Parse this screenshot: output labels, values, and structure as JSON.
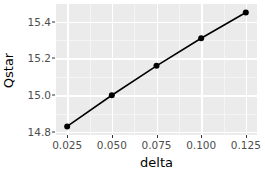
{
  "chart_data": {
    "type": "line",
    "title": "",
    "subtitle": "",
    "xlabel": "delta",
    "ylabel": "Qstar",
    "x": [
      0.025,
      0.05,
      0.075,
      0.1,
      0.125
    ],
    "values": [
      14.83,
      15.0,
      15.16,
      15.31,
      15.45
    ],
    "series": [
      {
        "name": "Qstar",
        "x": [
          0.025,
          0.05,
          0.075,
          0.1,
          0.125
        ],
        "values": [
          14.83,
          15.0,
          15.16,
          15.31,
          15.45
        ]
      }
    ],
    "xlim": [
      0.01875,
      0.13125
    ],
    "ylim": [
      14.7835,
      15.4965
    ],
    "x_ticks": [
      0.025,
      0.05,
      0.075,
      0.1,
      0.125
    ],
    "x_tick_labels": [
      "0.025",
      "0.050",
      "0.075",
      "0.100",
      "0.125"
    ],
    "y_ticks": [
      14.8,
      15.0,
      15.2,
      15.4
    ],
    "y_tick_labels": [
      "14.8",
      "15.0",
      "15.2",
      "15.4"
    ],
    "x_minor_ticks": [
      0.0375,
      0.0625,
      0.0875,
      0.1125
    ],
    "y_minor_ticks": [
      14.9,
      15.1,
      15.3
    ],
    "grid": true,
    "legend": false,
    "legend_position": "none",
    "marker": "circle",
    "line_color": "#000000",
    "point_color": "#000000",
    "panel_background": "#ebebeb",
    "grid_major_color": "#ffffff",
    "grid_minor_color": "#f5f5f5",
    "axis_text_color": "#4d4d4d",
    "axis_title_color": "#000000"
  }
}
